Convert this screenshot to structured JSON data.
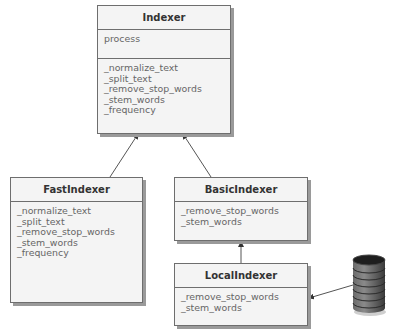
{
  "diagram": {
    "type": "uml-class-diagram",
    "classes": {
      "indexer": {
        "name": "Indexer",
        "public_methods": [
          "process"
        ],
        "private_methods": [
          "_normalize_text",
          "_split_text",
          "_remove_stop_words",
          "_stem_words",
          "_frequency"
        ]
      },
      "fast_indexer": {
        "name": "FastIndexer",
        "methods": [
          "_normalize_text",
          "_split_text",
          "_remove_stop_words",
          "_stem_words",
          "_frequency"
        ]
      },
      "basic_indexer": {
        "name": "BasicIndexer",
        "methods": [
          "_remove_stop_words",
          "_stem_words"
        ]
      },
      "local_indexer": {
        "name": "LocalIndexer",
        "methods": [
          "_remove_stop_words",
          "_stem_words"
        ]
      }
    },
    "relations": [
      {
        "from": "FastIndexer",
        "to": "Indexer",
        "type": "inheritance-arrow"
      },
      {
        "from": "BasicIndexer",
        "to": "Indexer",
        "type": "inheritance-arrow"
      },
      {
        "from": "LocalIndexer",
        "to": "BasicIndexer",
        "type": "inheritance-arrow"
      },
      {
        "from": "database",
        "to": "LocalIndexer",
        "type": "association-arrow"
      }
    ],
    "icons": {
      "database": "database-cylinder-icon"
    },
    "colors": {
      "box_fill": "#f4f4f4",
      "box_border": "#6e6e6e",
      "shadow": "#9a9a9a",
      "database": "#4a4a4a"
    }
  }
}
